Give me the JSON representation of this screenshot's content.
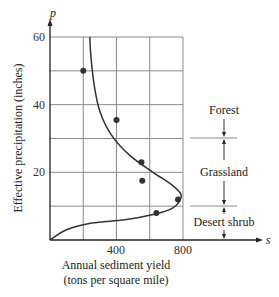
{
  "chart_data": {
    "type": "scatter",
    "title": "",
    "xlabel": "Annual sediment yield (tons per square mile)",
    "xlabel_lines": [
      "Annual sediment yield",
      "(tons per square mile)"
    ],
    "ylabel": "Effective precipitation (inches)",
    "x_var": "s",
    "y_var": "p",
    "xlim": [
      0,
      800
    ],
    "ylim": [
      0,
      60
    ],
    "x_ticks": [
      400,
      800
    ],
    "x_tick_labels": [
      "400",
      "800"
    ],
    "y_ticks": [
      20,
      40,
      60
    ],
    "y_tick_labels": [
      "20",
      "40",
      "60"
    ],
    "x_grid": [
      200,
      400,
      600,
      800
    ],
    "y_grid": [
      10,
      20,
      30,
      40,
      50,
      60
    ],
    "grid": true,
    "legend": null,
    "series": [
      {
        "name": "observed data",
        "type": "scatter",
        "points": [
          {
            "s": 200,
            "p": 50
          },
          {
            "s": 400,
            "p": 35.5
          },
          {
            "s": 550,
            "p": 23
          },
          {
            "s": 555,
            "p": 17.5
          },
          {
            "s": 770,
            "p": 12
          },
          {
            "s": 640,
            "p": 8
          }
        ]
      },
      {
        "name": "fitted curve",
        "type": "line",
        "points": [
          {
            "s": 0,
            "p": 0
          },
          {
            "s": 100,
            "p": 3
          },
          {
            "s": 250,
            "p": 5
          },
          {
            "s": 450,
            "p": 6
          },
          {
            "s": 620,
            "p": 7.5
          },
          {
            "s": 740,
            "p": 9.5
          },
          {
            "s": 790,
            "p": 13
          },
          {
            "s": 740,
            "p": 16
          },
          {
            "s": 620,
            "p": 20
          },
          {
            "s": 480,
            "p": 25
          },
          {
            "s": 370,
            "p": 31
          },
          {
            "s": 300,
            "p": 38
          },
          {
            "s": 265,
            "p": 46
          },
          {
            "s": 245,
            "p": 55
          },
          {
            "s": 240,
            "p": 60
          }
        ]
      }
    ],
    "annotations": [
      {
        "label": "Forest",
        "p_range": [
          30,
          60
        ]
      },
      {
        "label": "Grassland",
        "p_range": [
          10,
          30
        ]
      },
      {
        "label": "Desert shrub",
        "p_range": [
          0,
          10
        ]
      }
    ],
    "zone_boundaries": [
      30,
      10
    ]
  },
  "labels": {
    "y_var": "p",
    "x_var": "s",
    "ylabel": "Effective precipitation (inches)",
    "xlabel_line1": "Annual sediment yield",
    "xlabel_line2": "(tons per square mile)",
    "tick_x_400": "400",
    "tick_x_800": "800",
    "tick_y_20": "20",
    "tick_y_40": "40",
    "tick_y_60": "60",
    "zone_forest": "Forest",
    "zone_grassland": "Grassland",
    "zone_desert": "Desert shrub"
  },
  "colors": {
    "grid": "#8a8a8a",
    "axis": "#222222",
    "curve": "#333333",
    "points": "#333333"
  }
}
